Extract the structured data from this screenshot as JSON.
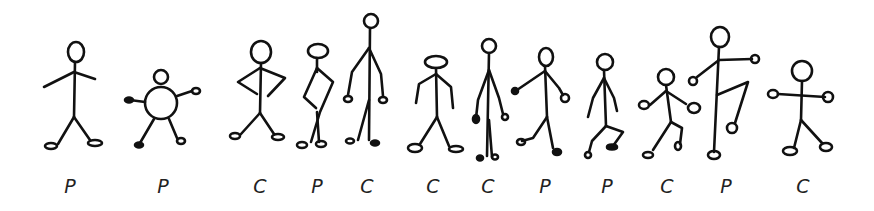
{
  "figures": [
    {
      "index": 1,
      "label": "P",
      "pose": "standing-arms-out"
    },
    {
      "index": 2,
      "label": "P",
      "pose": "round-body"
    },
    {
      "index": 3,
      "label": "C",
      "pose": "hands-on-hips"
    },
    {
      "index": 4,
      "label": "P",
      "pose": "hand-on-hip-crossed-legs"
    },
    {
      "index": 5,
      "label": "C",
      "pose": "tall-arms-down"
    },
    {
      "index": 6,
      "label": "C",
      "pose": "wide-head-stepping"
    },
    {
      "index": 7,
      "label": "C",
      "pose": "thin-standing"
    },
    {
      "index": 8,
      "label": "P",
      "pose": "walking-arm-forward"
    },
    {
      "index": 9,
      "label": "P",
      "pose": "crouching"
    },
    {
      "index": 10,
      "label": "C",
      "pose": "dancing"
    },
    {
      "index": 11,
      "label": "P",
      "pose": "kicking-leg-raised"
    },
    {
      "index": 12,
      "label": "C",
      "pose": "arms-spread-stepping"
    }
  ],
  "colors": {
    "ink": "#111111",
    "background": "#ffffff"
  }
}
